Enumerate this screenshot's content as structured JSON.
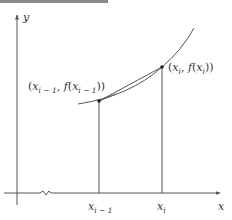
{
  "diagram": {
    "title": "",
    "axes": {
      "x_label": "x",
      "y_label": "y"
    },
    "points": [
      {
        "name": "left",
        "x_var": "x",
        "x_sub": "i − 1",
        "label": {
          "open": "(",
          "x": "x",
          "x_sub": "i − 1",
          "sep": ", ",
          "f": "f",
          "paren_open": "(",
          "fx": "x",
          "fx_sub": "i − 1",
          "close": "))"
        },
        "tick_label": {
          "x": "x",
          "sub": "i − 1"
        }
      },
      {
        "name": "right",
        "x_var": "x",
        "x_sub": "i",
        "label": {
          "open": "(",
          "x": "x",
          "x_sub": "i",
          "sep": ", ",
          "f": "f",
          "paren_open": "(",
          "fx": "x",
          "fx_sub": "i",
          "close": "))"
        },
        "tick_label": {
          "x": "x",
          "sub": "i"
        }
      }
    ],
    "elements": [
      "curve y = f(x)",
      "chord between points",
      "vertical drop lines",
      "x-axis break"
    ],
    "colors": {
      "line": "#555555",
      "text": "#333333",
      "bar": "#8a8a8a"
    }
  }
}
